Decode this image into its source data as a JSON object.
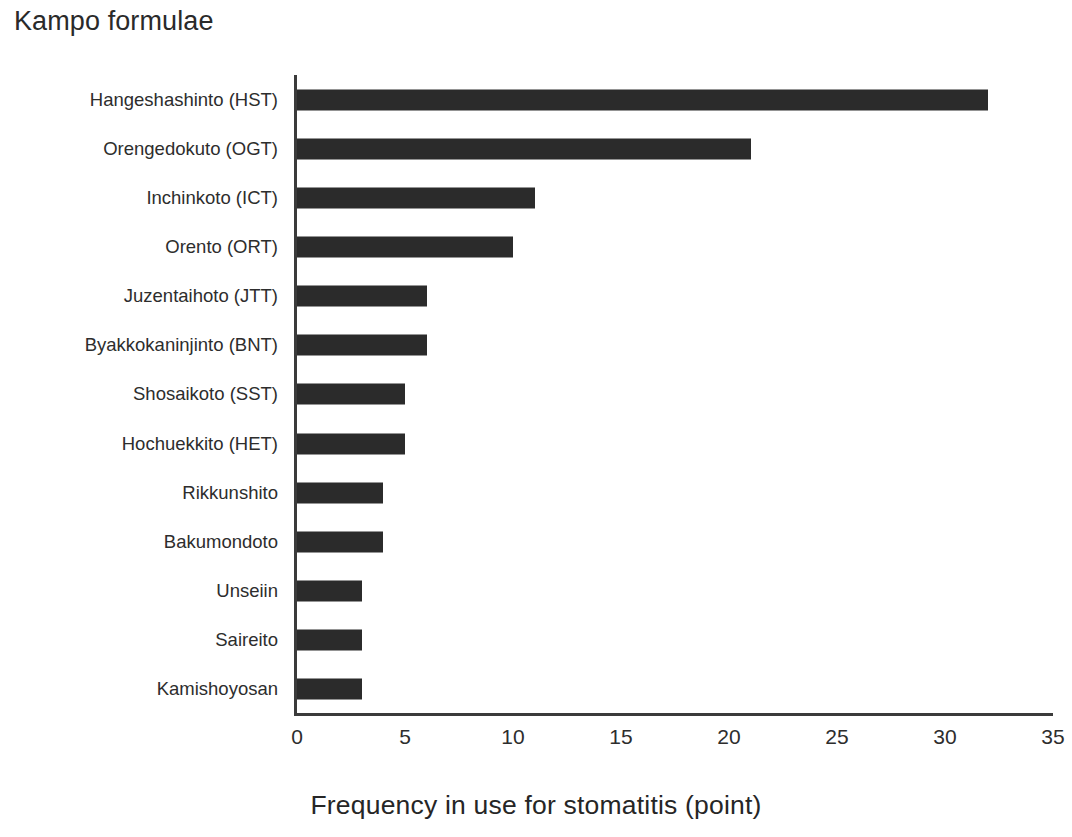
{
  "chart_data": {
    "type": "bar",
    "orientation": "horizontal",
    "title": "Kampo formulae",
    "xlabel": "Frequency in use for stomatitis (point)",
    "ylabel": "Kampo formulae",
    "categories": [
      "Hangeshashinto (HST)",
      "Orengedokuto (OGT)",
      "Inchinkoto (ICT)",
      "Orento (ORT)",
      "Juzentaihoto (JTT)",
      "Byakkokaninjinto (BNT)",
      "Shosaikoto (SST)",
      "Hochuekkito (HET)",
      "Rikkunshito",
      "Bakumondoto",
      "Unseiin",
      "Saireito",
      "Kamishoyosan"
    ],
    "values": [
      32,
      21,
      11,
      10,
      6,
      6,
      5,
      5,
      4,
      4,
      3,
      3,
      3
    ],
    "xlim": [
      0,
      35
    ],
    "xticks": [
      0,
      5,
      10,
      15,
      20,
      25,
      30,
      35
    ],
    "xtick_labels": [
      "0",
      "5",
      "10",
      "15",
      "20",
      "25",
      "30",
      "35"
    ],
    "grid": false,
    "legend": false,
    "bar_color": "#2b2b2b",
    "axis_color": "#3b3b3b",
    "background_color": "#ffffff"
  }
}
